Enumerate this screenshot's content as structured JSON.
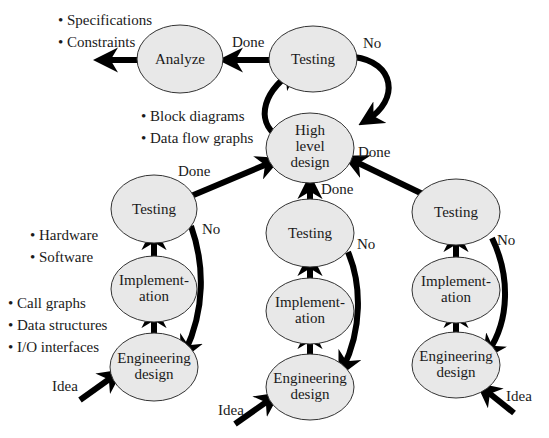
{
  "diagram": {
    "type": "design-process-flow",
    "colors": {
      "node_fill": "#e8e8e8",
      "node_stroke": "#333333",
      "arrow": "#000000",
      "text": "#1a1a1a",
      "background": "#ffffff"
    },
    "nodes": {
      "analyze": "Analyze",
      "top_testing": "Testing",
      "high_level_design": [
        "High",
        "level",
        "design"
      ],
      "left_testing": "Testing",
      "left_implementation": [
        "Implement-",
        "ation"
      ],
      "left_engineering": [
        "Engineering",
        "design"
      ],
      "mid_testing": "Testing",
      "mid_implementation": [
        "Implement-",
        "ation"
      ],
      "mid_engineering": [
        "Engineering",
        "design"
      ],
      "right_testing": "Testing",
      "right_implementation": [
        "Implement-",
        "ation"
      ],
      "right_engineering": [
        "Engineering",
        "design"
      ]
    },
    "edge_labels": {
      "top_done": "Done",
      "top_no": "No",
      "hld_done_right": "Done",
      "left_done": "Done",
      "left_no": "No",
      "mid_done": "Done",
      "mid_no": "No",
      "right_no": "No",
      "left_idea": "Idea",
      "mid_idea": "Idea",
      "right_idea": "Idea"
    },
    "annotations": {
      "analyze_outputs": [
        "• Specifications",
        "• Constraints"
      ],
      "hld_outputs": [
        "• Block diagrams",
        "• Data flow graphs"
      ],
      "impl_outputs": [
        "• Hardware",
        "• Software"
      ],
      "eng_outputs": [
        "• Call graphs",
        "• Data structures",
        "• I/O interfaces"
      ]
    }
  }
}
